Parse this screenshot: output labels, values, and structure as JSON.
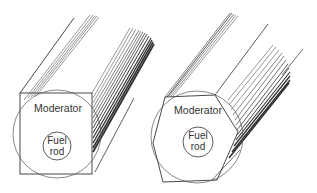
{
  "figure": {
    "panels": [
      {
        "id": "square-cell",
        "shape": "square prism",
        "moderator_label": "Moderator",
        "fuel_label_line1": "Fuel",
        "fuel_label_line2": "rod"
      },
      {
        "id": "hexagonal-cell",
        "shape": "hexagonal prism",
        "moderator_label": "Moderator",
        "fuel_label_line1": "Fuel",
        "fuel_label_line2": "rod"
      }
    ],
    "colors": {
      "line": "#333333",
      "shading": "#111111",
      "background": "#ffffff"
    }
  }
}
